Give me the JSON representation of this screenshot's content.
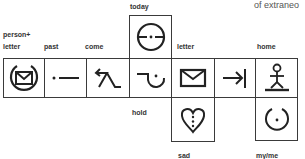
{
  "header_fragment": "of extraneo",
  "labels": {
    "today": "today",
    "person_letter_1": "person+",
    "person_letter_2": "letter",
    "past": "past",
    "come": "come",
    "letter": "letter",
    "home": "home",
    "hold": "hold",
    "sad": "sad",
    "my_me": "my/me"
  },
  "symbols": [
    {
      "meaning": "person+letter",
      "icon": "envelope-in-circle-icon"
    },
    {
      "meaning": "past",
      "icon": "dot-dash-icon"
    },
    {
      "meaning": "come",
      "icon": "arrow-figure-icon"
    },
    {
      "meaning": "today",
      "icon": "circle-bar-dot-icon"
    },
    {
      "meaning": "hold",
      "icon": "hook-cup-dot-icon"
    },
    {
      "meaning": "letter",
      "icon": "envelope-icon"
    },
    {
      "meaning": "to",
      "icon": "arrow-to-bar-icon"
    },
    {
      "meaning": "home",
      "icon": "stick-person-on-ground-icon"
    },
    {
      "meaning": "sad",
      "icon": "heart-dotted-icon"
    },
    {
      "meaning": "my/me",
      "icon": "open-circle-dot-icon"
    }
  ],
  "colors": {
    "ink": "#222222",
    "label": "#333333",
    "background": "#ffffff"
  }
}
